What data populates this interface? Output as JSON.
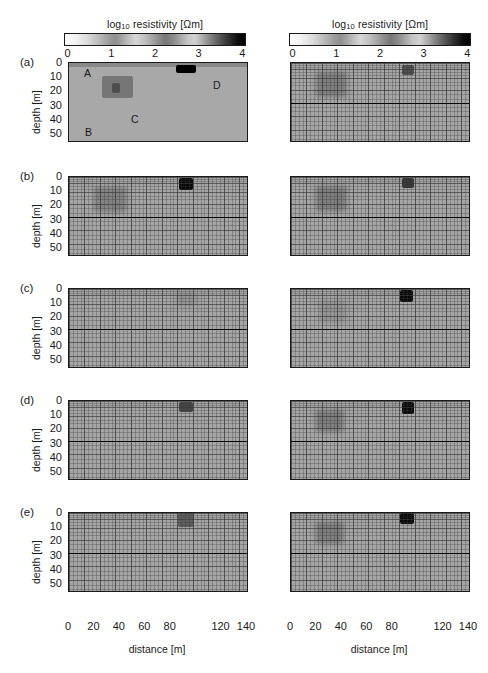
{
  "figure": {
    "colorbars": [
      {
        "title_prefix": "log",
        "title_sub": "10",
        "title_rest": " resistivity [Ωm]",
        "ticks": [
          "0",
          "1",
          "2",
          "3",
          "4"
        ]
      },
      {
        "title_prefix": "log",
        "title_sub": "10",
        "title_rest": " resistivity [Ωm]",
        "ticks": [
          "0",
          "1",
          "2",
          "3",
          "4"
        ]
      }
    ],
    "panel_labels": [
      "(a)",
      "(b)",
      "(c)",
      "(d)",
      "(e)"
    ],
    "y_axis": {
      "label": "depth [m]",
      "ticks": [
        "0",
        "10",
        "20",
        "30",
        "40",
        "50"
      ]
    },
    "x_axis": {
      "label": "distance [m]",
      "ticks": [
        "0",
        "20",
        "40",
        "60",
        "80",
        "120",
        "140"
      ]
    },
    "feature_tags": [
      {
        "text": "A"
      },
      {
        "text": "B"
      },
      {
        "text": "C"
      },
      {
        "text": "D"
      }
    ]
  },
  "chart_data": {
    "type": "heatmap",
    "title": "",
    "subtitle": "",
    "xlabel": "distance [m]",
    "ylabel": "depth [m]",
    "colorbar_label": "log10 resistivity [Ohm m]",
    "colorbar_ticks": [
      0,
      1,
      2,
      3,
      4
    ],
    "colormap": "grayscale_inverted_white_to_black",
    "xlim": [
      0,
      140
    ],
    "ylim": [
      0,
      55
    ],
    "xticks": [
      0,
      20,
      40,
      60,
      80,
      120,
      140
    ],
    "yticks": [
      0,
      10,
      20,
      30,
      40,
      50
    ],
    "grid": "finite-element mesh overlay on inverted panels",
    "legend": "none",
    "rows": [
      {
        "panel": "(a)",
        "description": "synthetic true model (left) and reference mesh model (right)",
        "left": {
          "has_mesh": false,
          "background_log_resistivity": 1.9,
          "bedrock_depth_m": null,
          "features": [
            {
              "tag": "A",
              "kind": "surface layer",
              "x_range_m": [
                0,
                140
              ],
              "depth_range_m": [
                0,
                2.5
              ],
              "log_resistivity": 2.35
            },
            {
              "tag": "B",
              "kind": "background halfspace",
              "x_range_m": [
                0,
                140
              ],
              "depth_range_m": [
                2.5,
                55
              ],
              "log_resistivity": 1.85
            },
            {
              "tag": "C",
              "kind": "block anomaly",
              "x_range_m": [
                26,
                50
              ],
              "depth_range_m": [
                9,
                25
              ],
              "log_resistivity": 2.6,
              "core": {
                "x_range_m": [
                  34,
                  40
                ],
                "depth_range_m": [
                  14,
                  21
                ],
                "log_resistivity": 3.1
              }
            },
            {
              "tag": "D",
              "kind": "resistive block",
              "x_range_m": [
                84,
                100
              ],
              "depth_range_m": [
                1.5,
                7
              ],
              "log_resistivity": 4.0
            }
          ]
        },
        "right": {
          "has_mesh": true,
          "bedrock_depth_m": 28,
          "features": [
            {
              "kind": "diffuse anomaly",
              "x_center_m": 32,
              "depth_center_m": 15,
              "x_width_m": 24,
              "depth_height_m": 18,
              "log_resistivity": 2.5
            },
            {
              "kind": "compact anomaly",
              "x_center_m": 92,
              "depth_center_m": 5,
              "x_width_m": 9,
              "depth_height_m": 7,
              "log_resistivity": 3.1
            }
          ]
        }
      },
      {
        "panel": "(b)",
        "description": "inversion result, configuration b",
        "left": {
          "has_mesh": true,
          "bedrock_depth_m": 28,
          "features": [
            {
              "kind": "diffuse anomaly",
              "x_center_m": 33,
              "depth_center_m": 16,
              "x_width_m": 26,
              "depth_height_m": 18,
              "log_resistivity": 2.45
            },
            {
              "kind": "compact anomaly",
              "x_center_m": 92,
              "depth_center_m": 5,
              "x_width_m": 11,
              "depth_height_m": 8,
              "log_resistivity": 3.9
            }
          ]
        },
        "right": {
          "has_mesh": true,
          "bedrock_depth_m": 28,
          "features": [
            {
              "kind": "diffuse anomaly",
              "x_center_m": 32,
              "depth_center_m": 15,
              "x_width_m": 24,
              "depth_height_m": 18,
              "log_resistivity": 2.5
            },
            {
              "kind": "compact anomaly",
              "x_center_m": 92,
              "depth_center_m": 4,
              "x_width_m": 9,
              "depth_height_m": 7,
              "log_resistivity": 3.4
            }
          ]
        }
      },
      {
        "panel": "(c)",
        "description": "inversion result, configuration c",
        "left": {
          "has_mesh": true,
          "bedrock_depth_m": 28,
          "features": [
            {
              "kind": "faint anomaly",
              "x_center_m": 92,
              "depth_center_m": 7,
              "x_width_m": 16,
              "depth_height_m": 10,
              "log_resistivity": 2.2
            }
          ]
        },
        "right": {
          "has_mesh": true,
          "bedrock_depth_m": 28,
          "features": [
            {
              "kind": "faint anomaly",
              "x_center_m": 33,
              "depth_center_m": 16,
              "x_width_m": 22,
              "depth_height_m": 16,
              "log_resistivity": 2.2
            },
            {
              "kind": "compact anomaly",
              "x_center_m": 91,
              "depth_center_m": 5,
              "x_width_m": 10,
              "depth_height_m": 8,
              "log_resistivity": 3.9
            }
          ]
        }
      },
      {
        "panel": "(d)",
        "description": "inversion result, configuration d",
        "left": {
          "has_mesh": true,
          "bedrock_depth_m": 28,
          "features": [
            {
              "kind": "compact anomaly",
              "x_center_m": 92,
              "depth_center_m": 4,
              "x_width_m": 11,
              "depth_height_m": 7,
              "log_resistivity": 3.2
            }
          ]
        },
        "right": {
          "has_mesh": true,
          "bedrock_depth_m": 28,
          "features": [
            {
              "kind": "diffuse anomaly",
              "x_center_m": 31,
              "depth_center_m": 14,
              "x_width_m": 22,
              "depth_height_m": 16,
              "log_resistivity": 2.5
            },
            {
              "kind": "compact anomaly",
              "x_center_m": 92,
              "depth_center_m": 5,
              "x_width_m": 10,
              "depth_height_m": 8,
              "log_resistivity": 3.9
            }
          ]
        }
      },
      {
        "panel": "(e)",
        "description": "inversion result, configuration e",
        "left": {
          "has_mesh": true,
          "bedrock_depth_m": 28,
          "features": [
            {
              "kind": "compact anomaly",
              "x_center_m": 92,
              "depth_center_m": 5,
              "x_width_m": 13,
              "depth_height_m": 10,
              "log_resistivity": 2.9
            }
          ]
        },
        "right": {
          "has_mesh": true,
          "bedrock_depth_m": 28,
          "features": [
            {
              "kind": "diffuse anomaly",
              "x_center_m": 31,
              "depth_center_m": 14,
              "x_width_m": 22,
              "depth_height_m": 16,
              "log_resistivity": 2.5
            },
            {
              "kind": "compact anomaly",
              "x_center_m": 91,
              "depth_center_m": 4,
              "x_width_m": 11,
              "depth_height_m": 8,
              "log_resistivity": 3.9
            }
          ]
        }
      }
    ]
  }
}
